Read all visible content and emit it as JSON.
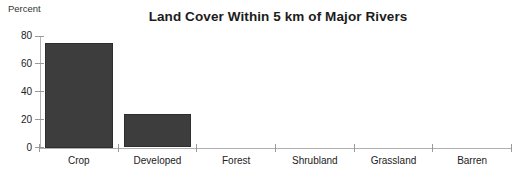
{
  "chart_data": {
    "type": "bar",
    "title": "Land Cover Within 5 km of Major Rivers",
    "xlabel": "",
    "ylabel": "Percent",
    "categories": [
      "Crop",
      "Developed",
      "Forest",
      "Shrubland",
      "Grassland",
      "Barren"
    ],
    "values": [
      75,
      24,
      0,
      0,
      0,
      0
    ],
    "ylim": [
      0,
      80
    ],
    "yticks": [
      0,
      20,
      40,
      60,
      80
    ],
    "ytick_labels": [
      "0",
      "20",
      "40",
      "60",
      "80"
    ],
    "grid": false,
    "legend": "none",
    "bar_color": "#3d3d3d",
    "axis_color": "#b0b0b0",
    "background_color": "#ffffff",
    "text_color": "#222222"
  },
  "axis": {
    "y_title": "Percent"
  }
}
